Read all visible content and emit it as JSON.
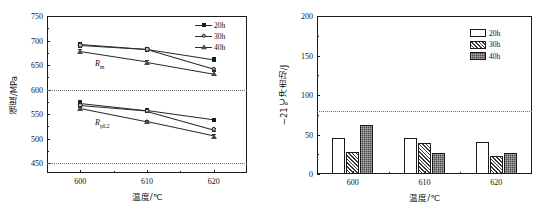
{
  "figure": {
    "panels": [
      "strength-line-chart",
      "impact-energy-bar-chart"
    ]
  },
  "chart_data": [
    {
      "id": "left",
      "type": "line",
      "title": "",
      "xlabel": "温度/℃",
      "ylabel": "强度/MPa",
      "x": [
        600,
        610,
        620
      ],
      "xticklabels": [
        "600",
        "610",
        "620"
      ],
      "xlim": [
        595,
        625
      ],
      "ylim": [
        430,
        750
      ],
      "yticks": [
        450,
        500,
        550,
        600,
        650,
        700,
        750
      ],
      "yticklabels": [
        "450",
        "500",
        "550",
        "600",
        "650",
        "700",
        "750"
      ],
      "grid": false,
      "legend_position": "top-right",
      "legend": [
        "20h",
        "30h",
        "40h"
      ],
      "reference_lines": [
        {
          "y": 600,
          "style": "dotted"
        },
        {
          "y": 450,
          "style": "dotted"
        }
      ],
      "annotations": [
        {
          "text": "Rm",
          "label_main": "R",
          "label_sub": "m",
          "x": 602.2,
          "y": 663
        },
        {
          "text": "Rp0.2",
          "label_main": "R",
          "label_sub": "p0.2",
          "x": 602.2,
          "y": 542
        }
      ],
      "groups": [
        {
          "name": "Rm",
          "series": [
            {
              "name": "20h",
              "marker": "filled-square",
              "values": [
                693,
                683,
                662
              ],
              "err": [
                5,
                3,
                3
              ]
            },
            {
              "name": "30h",
              "marker": "open-circle",
              "values": [
                690,
                682,
                642
              ],
              "err": [
                4,
                3,
                3
              ]
            },
            {
              "name": "40h",
              "marker": "filled-triangle",
              "values": [
                678,
                657,
                633
              ],
              "err": [
                4,
                3,
                4
              ]
            }
          ]
        },
        {
          "name": "Rp0.2",
          "series": [
            {
              "name": "20h",
              "marker": "filled-square",
              "values": [
                573,
                558,
                539
              ],
              "err": [
                5,
                3,
                3
              ]
            },
            {
              "name": "30h",
              "marker": "open-circle",
              "values": [
                568,
                557,
                519
              ],
              "err": [
                4,
                3,
                3
              ]
            },
            {
              "name": "40h",
              "marker": "filled-triangle",
              "values": [
                562,
                535,
                506
              ],
              "err": [
                4,
                3,
                4
              ]
            }
          ]
        }
      ]
    },
    {
      "id": "right",
      "type": "bar",
      "title": "",
      "xlabel": "温度/℃",
      "ylabel": "−21℃冲击功/J",
      "categories": [
        "600",
        "610",
        "620"
      ],
      "xticklabels": [
        "600",
        "610",
        "620"
      ],
      "ylim": [
        0,
        200
      ],
      "yticks": [
        0,
        50,
        100,
        150,
        200
      ],
      "yticklabels": [
        "0",
        "50",
        "100",
        "150",
        "200"
      ],
      "grid": false,
      "legend_position": "top-right",
      "legend": [
        "20h",
        "30h",
        "40h"
      ],
      "reference_lines": [
        {
          "y": 80,
          "style": "dotted"
        }
      ],
      "series": [
        {
          "name": "20h",
          "fill": "white",
          "values": [
            46,
            45,
            41
          ]
        },
        {
          "name": "30h",
          "fill": "hatched",
          "values": [
            28,
            39,
            23
          ]
        },
        {
          "name": "40h",
          "fill": "dark-checker",
          "values": [
            62,
            27,
            26
          ]
        }
      ]
    }
  ],
  "colors": {
    "axis": "#1a1a1a",
    "refline": "#6e6e6e",
    "series_20h": "#1a1a1a",
    "series_30h": "#b8b8b8",
    "series_40h": "#4a4a4a"
  }
}
